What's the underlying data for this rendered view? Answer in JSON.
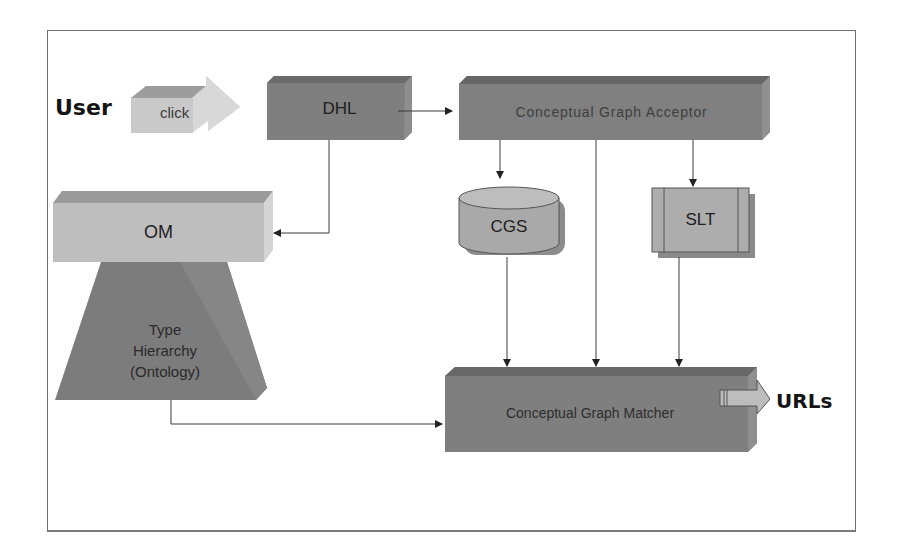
{
  "diagram": {
    "type": "system-architecture",
    "colors": {
      "dark_box": "#7d7d7d",
      "dark_box_top": "#6a6a6a",
      "light_box": "#bdbdbd",
      "light_box_top": "#9a9a9a",
      "light_box_side": "#d2d2d2",
      "arrow_fill": "#c8c8c8",
      "line": "#3a3a3a",
      "frame": "#6f6f6f"
    },
    "nodes": {
      "user": {
        "label": "User"
      },
      "click_arrow": {
        "label": "click"
      },
      "dhl": {
        "label": "DHL"
      },
      "acceptor": {
        "label": "Conceptual Graph Acceptor"
      },
      "om": {
        "label": "OM"
      },
      "type_hierarchy": {
        "line1": "Type",
        "line2": "Hierarchy",
        "line3": "(Ontology)"
      },
      "cgs": {
        "label": "CGS"
      },
      "slt": {
        "label": "SLT"
      },
      "matcher": {
        "label": "Conceptual Graph Matcher"
      },
      "urls": {
        "label": "URLs"
      }
    },
    "edges": [
      {
        "from": "user",
        "to": "dhl",
        "label": "click"
      },
      {
        "from": "dhl",
        "to": "acceptor"
      },
      {
        "from": "dhl",
        "to": "om"
      },
      {
        "from": "acceptor",
        "to": "cgs"
      },
      {
        "from": "acceptor",
        "to": "matcher"
      },
      {
        "from": "acceptor",
        "to": "slt"
      },
      {
        "from": "cgs",
        "to": "matcher"
      },
      {
        "from": "slt",
        "to": "matcher"
      },
      {
        "from": "type_hierarchy",
        "to": "matcher"
      },
      {
        "from": "matcher",
        "to": "urls"
      }
    ]
  }
}
